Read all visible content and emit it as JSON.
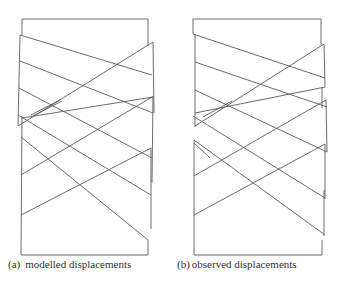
{
  "figure": {
    "panels": [
      {
        "id": "a",
        "label": "(a)",
        "caption": "modelled displacements",
        "stroke": "#555555"
      },
      {
        "id": "b",
        "label": "(b)",
        "caption": "observed displacements",
        "stroke": "#555555"
      }
    ]
  }
}
